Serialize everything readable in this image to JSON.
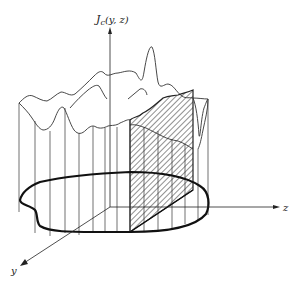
{
  "figure": {
    "type": "3d-surface-diagram",
    "axes": {
      "vertical": {
        "label_main": "J",
        "label_sub": "c",
        "label_args": "(y, z)"
      },
      "z": {
        "label": "z"
      },
      "y": {
        "label": "y"
      }
    },
    "colors": {
      "stroke": "#333333",
      "background": "#ffffff"
    }
  }
}
